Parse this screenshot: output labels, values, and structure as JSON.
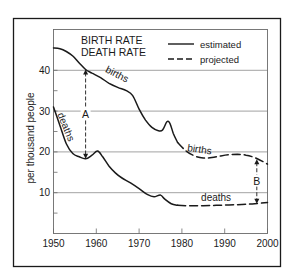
{
  "chart_data": {
    "type": "line",
    "title_lines": [
      "BIRTH RATE",
      "DEATH RATE"
    ],
    "xlabel": "",
    "ylabel": "per thousand people",
    "xlim": [
      1950,
      2000
    ],
    "ylim": [
      0,
      50
    ],
    "x_ticks": [
      1950,
      1960,
      1970,
      1980,
      1990,
      2000
    ],
    "y_ticks_labeled": [
      10,
      20,
      30,
      40
    ],
    "y_ticks_minor": [
      5,
      15,
      25,
      35
    ],
    "grid": "horizontal at 10, 20, 30, 40",
    "legend": {
      "position": "upper right",
      "entries": [
        {
          "label": "estimated",
          "style": "solid"
        },
        {
          "label": "projected",
          "style": "dashed"
        }
      ]
    },
    "series": [
      {
        "name": "births",
        "label": "births",
        "estimated": {
          "x": [
            1950,
            1951.5,
            1953,
            1954.5,
            1956,
            1957.5,
            1959,
            1961,
            1963,
            1965,
            1967,
            1968.5,
            1970,
            1971.5,
            1973,
            1974.5,
            1975.5,
            1976.5,
            1977.2,
            1978,
            1979
          ],
          "y": [
            45.5,
            45.3,
            44.6,
            43.5,
            41.8,
            40.2,
            39.3,
            38.2,
            36.8,
            35.8,
            35.0,
            33.8,
            30.5,
            27.8,
            26.0,
            25.2,
            25.4,
            27.4,
            27.0,
            24.5,
            22.3
          ]
        },
        "projected": {
          "x": [
            1979,
            1981,
            1983,
            1985,
            1987,
            1989,
            1991,
            1993,
            1995,
            1997,
            1999,
            2000
          ],
          "y": [
            22.3,
            20.2,
            19.0,
            18.5,
            18.6,
            19.0,
            19.3,
            19.4,
            19.2,
            18.6,
            17.6,
            17.0
          ]
        }
      },
      {
        "name": "deaths",
        "label": "deaths",
        "estimated": {
          "x": [
            1950,
            1951.5,
            1953,
            1954.5,
            1956,
            1957.5,
            1959,
            1960.3,
            1961.5,
            1963,
            1964.5,
            1966,
            1968,
            1970,
            1972,
            1973.5,
            1975,
            1976,
            1977.5,
            1979
          ],
          "y": [
            31.0,
            26.5,
            22.0,
            19.6,
            18.8,
            18.3,
            19.2,
            20.2,
            18.8,
            16.5,
            14.8,
            13.6,
            12.4,
            11.0,
            9.5,
            9.0,
            9.4,
            8.4,
            7.3,
            6.9
          ]
        },
        "projected": {
          "x": [
            1979,
            1982,
            1985,
            1988,
            1991,
            1994,
            1997,
            2000
          ],
          "y": [
            6.9,
            6.8,
            6.8,
            6.9,
            7.0,
            7.1,
            7.3,
            7.6
          ]
        }
      }
    ],
    "annotations": [
      {
        "label": "A",
        "x": 1957.5,
        "y_from": 40.2,
        "y_to": 18.3,
        "meaning": "birth rate minus death rate gap ~1957"
      },
      {
        "label": "B",
        "x": 1997.5,
        "y_from": 18.2,
        "y_to": 7.3,
        "meaning": "projected gap ~1997"
      }
    ],
    "series_text_labels": [
      {
        "text": "births",
        "x": 1964.5,
        "y": 38.3,
        "rotate": 27
      },
      {
        "text": "deaths",
        "x": 1952.2,
        "y": 25.8,
        "rotate": 68
      },
      {
        "text": "births",
        "x": 1984,
        "y": 19.8,
        "rotate": 8
      },
      {
        "text": "deaths",
        "x": 1988,
        "y": 8.0,
        "rotate": 0
      }
    ]
  },
  "colors": {
    "ink": "#1a1a1a",
    "grid": "#8a8a8a",
    "background": "#ffffff"
  }
}
